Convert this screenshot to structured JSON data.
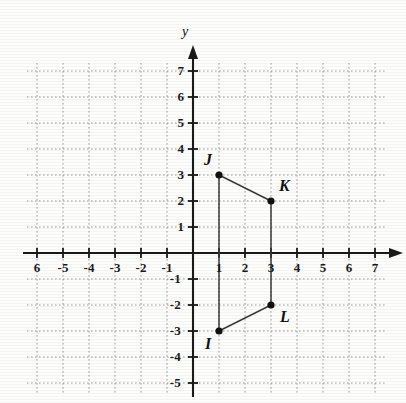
{
  "figure": {
    "axis_labels": {
      "y": "y",
      "x": ""
    },
    "x_axis": {
      "min": -6,
      "max": 7,
      "tick_labels": [
        "6",
        "-5",
        "-4",
        "-3",
        "-2",
        "-1",
        "1",
        "2",
        "3",
        "4",
        "5",
        "6",
        "7"
      ],
      "tick_values": [
        -6,
        -5,
        -4,
        -3,
        -2,
        -1,
        1,
        2,
        3,
        4,
        5,
        6,
        7
      ]
    },
    "y_axis": {
      "min": -5,
      "max": 7,
      "tick_labels": [
        "7",
        "6",
        "5",
        "4",
        "3",
        "2",
        "1",
        "-1",
        "-2",
        "-3",
        "-4",
        "-5"
      ],
      "tick_values": [
        7,
        6,
        5,
        4,
        3,
        2,
        1,
        -1,
        -2,
        -3,
        -4,
        -5
      ]
    },
    "origin_label": "",
    "grid": {
      "visible": true,
      "style": "dotted",
      "color": "#9a9a9a"
    },
    "axis_color": "#1a1a1a"
  },
  "chart_data": {
    "type": "scatter",
    "title": "",
    "xlabel": "",
    "ylabel": "y",
    "xlim": [
      -6,
      7
    ],
    "ylim": [
      -5,
      7
    ],
    "grid": true,
    "legend": "none",
    "points": [
      {
        "label": "J",
        "x": 1,
        "y": 3,
        "label_pos": "above-left"
      },
      {
        "label": "K",
        "x": 3,
        "y": 2,
        "label_pos": "above-right"
      },
      {
        "label": "L",
        "x": 3,
        "y": -2,
        "label_pos": "below-right"
      },
      {
        "label": "I",
        "x": 1,
        "y": -3,
        "label_pos": "below-left"
      }
    ],
    "segments": [
      {
        "from": "J",
        "to": "K"
      },
      {
        "from": "K",
        "to": "L"
      },
      {
        "from": "L",
        "to": "I"
      },
      {
        "from": "I",
        "to": "J"
      }
    ],
    "shape": "quadrilateral",
    "marker": {
      "type": "filled-circle",
      "color": "#111111",
      "size": 6
    },
    "line_color": "#3a3a3a"
  }
}
